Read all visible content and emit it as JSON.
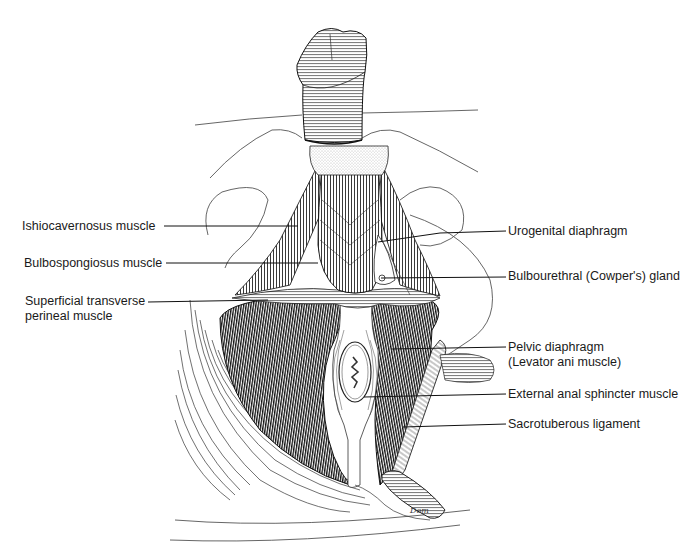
{
  "diagram": {
    "labels_left": [
      {
        "id": "ishiocavernosus",
        "text": "Ishiocavernosus muscle",
        "x": 22,
        "y": 219,
        "line": [
          164,
          226,
          298,
          226
        ]
      },
      {
        "id": "bulbospongiosus",
        "text": "Bulbospongiosus muscle",
        "x": 24,
        "y": 256,
        "line": [
          166,
          263,
          318,
          263
        ]
      },
      {
        "id": "superficial-transverse",
        "text": "Superficial transverse",
        "text2": "perineal muscle",
        "x": 25,
        "y": 294,
        "line": [
          148,
          302,
          268,
          300
        ]
      }
    ],
    "labels_right": [
      {
        "id": "urogenital-diaphragm",
        "text": "Urogenital diaphragm",
        "x": 508,
        "y": 224,
        "line": [
          378,
          242,
          440,
          233,
          506,
          231
        ]
      },
      {
        "id": "bulbourethral-gland",
        "text": "Bulbourethral (Cowper's) gland",
        "x": 508,
        "y": 269,
        "line": [
          381,
          278,
          506,
          277
        ]
      },
      {
        "id": "pelvic-diaphragm",
        "text": "Pelvic diaphragm",
        "text2": "(Levator ani muscle)",
        "x": 508,
        "y": 340,
        "line": [
          391,
          349,
          506,
          347
        ]
      },
      {
        "id": "external-anal-sphincter",
        "text": "External anal sphincter muscle",
        "x": 508,
        "y": 387,
        "line": [
          364,
          397,
          506,
          394
        ]
      },
      {
        "id": "sacrotuberous-ligament",
        "text": "Sacrotuberous ligament",
        "x": 508,
        "y": 417,
        "line": [
          403,
          427,
          506,
          424
        ]
      }
    ],
    "signature": "Dom"
  },
  "colors": {
    "background": "#ffffff",
    "ink": "#1a1a1a",
    "muscle_dark": "#2a2a2a",
    "outline": "#444444"
  }
}
